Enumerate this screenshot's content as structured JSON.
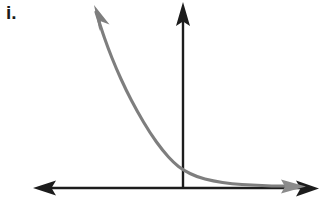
{
  "figure": {
    "part_label": "i.",
    "axis_color": "#1c1c1c",
    "curve_color": "#7e7e7e",
    "background_color": "#ffffff",
    "canvas": {
      "width": 322,
      "height": 202
    }
  },
  "chart_data": {
    "type": "line",
    "title": "i.",
    "subtitle": "",
    "xlabel": "",
    "ylabel": "",
    "grid": false,
    "legend": false,
    "legend_position": "none",
    "axes": {
      "x_axis": {
        "y_pixel": 188,
        "x_start_pixel": 33,
        "x_end_pixel": 318,
        "arrowheads": "both",
        "tick_labels": [],
        "color": "#1c1c1c"
      },
      "y_axis": {
        "x_pixel": 183,
        "y_start_pixel": 188,
        "y_end_pixel": 3,
        "arrowheads": "top",
        "tick_labels": [],
        "color": "#1c1c1c"
      },
      "origin_pixel": [
        183,
        188
      ]
    },
    "series": [
      {
        "name": "exponential decay",
        "color": "#7e7e7e",
        "arrowheads": "both",
        "x": [
          -4.5,
          -4.0,
          -3.5,
          -3.0,
          -2.5,
          -2.0,
          -1.5,
          -1.0,
          -0.5,
          0.0,
          0.5,
          1.0,
          1.5,
          2.0,
          2.5,
          3.0,
          3.5,
          4.0
        ],
        "y": [
          13.5,
          11.1,
          8.6,
          6.6,
          5.0,
          3.7,
          2.7,
          1.9,
          1.4,
          1.0,
          0.72,
          0.52,
          0.38,
          0.29,
          0.23,
          0.19,
          0.16,
          0.14
        ],
        "pixel_path": [
          [
            96,
            12
          ],
          [
            101,
            28
          ],
          [
            108,
            48
          ],
          [
            116,
            68
          ],
          [
            126,
            90
          ],
          [
            137,
            111
          ],
          [
            150,
            133
          ],
          [
            163,
            151
          ],
          [
            174,
            163
          ],
          [
            183,
            170
          ],
          [
            197,
            177
          ],
          [
            213,
            181
          ],
          [
            232,
            184
          ],
          [
            252,
            185
          ],
          [
            272,
            186
          ],
          [
            290,
            186
          ]
        ]
      }
    ],
    "xlim": [
      -4.8,
      4.5
    ],
    "ylim": [
      0,
      15
    ]
  }
}
